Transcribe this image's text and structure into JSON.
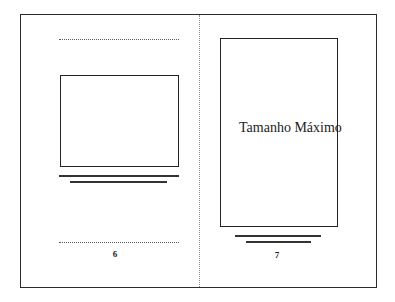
{
  "diagram": {
    "type": "book-spread-layout",
    "left_page": {
      "page_number": "6",
      "elements": [
        "top-dotted-guide",
        "image-frame",
        "caption-line-1",
        "caption-line-2",
        "bottom-dotted-guide",
        "page-number"
      ]
    },
    "right_page": {
      "page_number": "7",
      "frame_label": "Tamanho Máximo",
      "elements": [
        "image-frame-max-size",
        "caption-line-1",
        "caption-line-2",
        "page-number"
      ]
    },
    "colors": {
      "background": "#ffffff",
      "stroke": "#222222",
      "dotted": "#5a5a5a"
    }
  }
}
